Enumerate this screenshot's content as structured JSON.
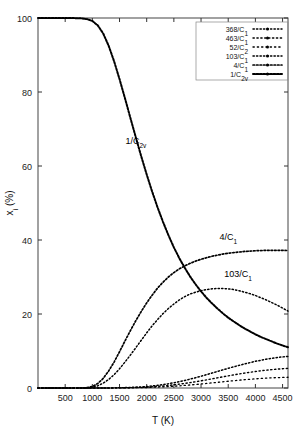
{
  "chart_data": {
    "type": "line",
    "title": "",
    "xlabel": "T (K)",
    "ylabel": "x_i (%)",
    "ylabel_main": "x",
    "ylabel_sub": "i",
    "ylabel_unit": " (%)",
    "xlim": [
      0,
      4600
    ],
    "ylim": [
      0,
      100
    ],
    "xticks": [
      500,
      1000,
      1500,
      2000,
      2500,
      3000,
      3500,
      4000,
      4500
    ],
    "xticklabels": [
      "500",
      "1000",
      "1500",
      "2000",
      "2500",
      "3000",
      "3500",
      "4000",
      "4500"
    ],
    "yticks": [
      0,
      20,
      40,
      60,
      80,
      100
    ],
    "yticklabels": [
      "0",
      "20",
      "40",
      "60",
      "80",
      "100"
    ],
    "grid": false,
    "legend_position": "top-right",
    "x": [
      0,
      200,
      400,
      600,
      800,
      900,
      1000,
      1100,
      1200,
      1300,
      1400,
      1500,
      1600,
      1700,
      1800,
      1900,
      2000,
      2100,
      2200,
      2300,
      2400,
      2500,
      2600,
      2700,
      2800,
      2900,
      3000,
      3100,
      3200,
      3300,
      3400,
      3500,
      3600,
      3700,
      3800,
      3900,
      4000,
      4100,
      4200,
      4300,
      4400,
      4500,
      4600
    ],
    "series": [
      {
        "name": "368/C1",
        "label_main": "368/C",
        "label_sub": "1",
        "values": [
          0,
          0,
          0,
          0,
          0,
          0,
          0,
          0,
          0,
          0.02,
          0.04,
          0.07,
          0.1,
          0.15,
          0.22,
          0.3,
          0.4,
          0.55,
          0.72,
          0.92,
          1.15,
          1.42,
          1.72,
          2.05,
          2.4,
          2.78,
          3.18,
          3.6,
          4.03,
          4.46,
          4.9,
          5.32,
          5.73,
          6.12,
          6.5,
          6.86,
          7.2,
          7.5,
          7.78,
          8.02,
          8.23,
          8.4,
          8.55
        ]
      },
      {
        "name": "463/C1",
        "label_main": "463/C",
        "label_sub": "1",
        "values": [
          0,
          0,
          0,
          0,
          0,
          0,
          0,
          0,
          0,
          0.01,
          0.02,
          0.04,
          0.06,
          0.09,
          0.13,
          0.18,
          0.25,
          0.33,
          0.44,
          0.56,
          0.7,
          0.86,
          1.04,
          1.24,
          1.46,
          1.69,
          1.94,
          2.2,
          2.47,
          2.74,
          3.01,
          3.28,
          3.54,
          3.79,
          4.03,
          4.25,
          4.46,
          4.65,
          4.82,
          4.97,
          5.1,
          5.21,
          5.3
        ]
      },
      {
        "name": "52/C2",
        "label_main": "52/C",
        "label_sub": "2",
        "values": [
          0,
          0,
          0,
          0,
          0,
          0,
          0,
          0,
          0,
          0,
          0.01,
          0.02,
          0.03,
          0.05,
          0.07,
          0.1,
          0.14,
          0.19,
          0.25,
          0.32,
          0.4,
          0.49,
          0.59,
          0.7,
          0.82,
          0.95,
          1.09,
          1.23,
          1.38,
          1.53,
          1.68,
          1.83,
          1.97,
          2.11,
          2.24,
          2.36,
          2.47,
          2.57,
          2.66,
          2.74,
          2.8,
          2.85,
          2.9
        ]
      },
      {
        "name": "103/C1",
        "label_main": "103/C",
        "label_sub": "1",
        "values": [
          0,
          0,
          0,
          0,
          0,
          0.05,
          0.2,
          0.6,
          1.3,
          2.3,
          3.6,
          5.2,
          7.0,
          8.9,
          10.9,
          12.9,
          14.9,
          16.8,
          18.5,
          20.1,
          21.5,
          22.7,
          23.8,
          24.7,
          25.4,
          25.9,
          26.3,
          26.6,
          26.8,
          26.9,
          26.9,
          26.8,
          26.6,
          26.3,
          25.9,
          25.5,
          25.0,
          24.4,
          23.8,
          23.1,
          22.4,
          21.6,
          20.8
        ]
      },
      {
        "name": "4/C1",
        "label_main": "4/C",
        "label_sub": "1",
        "values": [
          0,
          0,
          0,
          0,
          0.02,
          0.1,
          0.4,
          1.2,
          2.6,
          4.6,
          7.0,
          9.8,
          12.7,
          15.5,
          18.2,
          20.7,
          23.0,
          25.1,
          27.0,
          28.6,
          30.0,
          31.2,
          32.2,
          33.0,
          33.7,
          34.3,
          34.8,
          35.2,
          35.6,
          35.9,
          36.2,
          36.4,
          36.6,
          36.75,
          36.9,
          37.0,
          37.1,
          37.15,
          37.2,
          37.2,
          37.2,
          37.2,
          37.15
        ]
      },
      {
        "name": "1/C2v",
        "label_main": "1/C",
        "label_sub": "2v",
        "values": [
          100,
          100,
          100,
          100,
          99.9,
          99.7,
          99.2,
          98.0,
          95.8,
          92.5,
          88.3,
          83.5,
          78.3,
          73.0,
          67.7,
          62.6,
          57.7,
          53.1,
          48.8,
          44.9,
          41.3,
          38.0,
          35.1,
          32.5,
          30.1,
          28.0,
          26.1,
          24.4,
          22.9,
          21.5,
          20.2,
          19.0,
          18.0,
          17.0,
          16.1,
          15.3,
          14.5,
          13.8,
          13.2,
          12.6,
          12.0,
          11.5,
          11.0
        ]
      }
    ],
    "annotations": [
      {
        "name": "1/C2v",
        "text_main": "1/C",
        "text_sub": "2v",
        "x": 1800,
        "y": 66
      },
      {
        "name": "4/C1",
        "text_main": "4/C",
        "text_sub": "1",
        "x": 3500,
        "y": 40
      },
      {
        "name": "103/C1",
        "text_main": "103/C",
        "text_sub": "1",
        "x": 3680,
        "y": 30
      }
    ]
  }
}
